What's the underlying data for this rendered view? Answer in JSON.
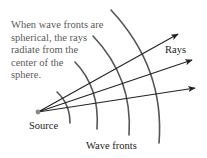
{
  "caption": {
    "lines": [
      "When wave fronts are",
      "spherical, the rays",
      "radiate from the",
      "center of the",
      "sphere."
    ]
  },
  "labels": {
    "rays": "Rays",
    "source": "Source",
    "wave_fronts": "Wave fronts"
  },
  "colors": {
    "arc": "#555555",
    "ray": "#222222",
    "source_dot": "#888888",
    "caption_text": "#5a5a5a"
  },
  "geometry": {
    "source": [
      38,
      112
    ],
    "rays_end": [
      [
        178,
        34
      ],
      [
        192,
        60
      ],
      [
        195,
        88
      ]
    ],
    "arcs": [
      {
        "top": [
          57,
          92
        ],
        "bottom": [
          70,
          123
        ]
      },
      {
        "top": [
          75,
          62
        ],
        "bottom": [
          97,
          129
        ]
      },
      {
        "top": [
          93,
          36
        ],
        "bottom": [
          129,
          135
        ]
      },
      {
        "top": [
          111,
          10
        ],
        "bottom": [
          159,
          143
        ]
      }
    ]
  }
}
